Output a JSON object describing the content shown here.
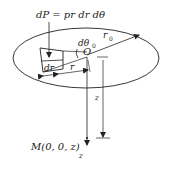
{
  "diagram": {
    "title_formula": "dP = pr dr dθ",
    "labels": {
      "formula": "dP = pr dr dθ",
      "d_theta": "dθ",
      "d_theta_sub": "0",
      "center": "O",
      "radius": "r",
      "radius_sub": "0",
      "r": "r",
      "dr": "dr",
      "z_dim": "z",
      "point_m": "M(0, 0, z)",
      "z_axis": "z"
    },
    "colors": {
      "stroke": "#222222",
      "background": "#ffffff"
    }
  }
}
